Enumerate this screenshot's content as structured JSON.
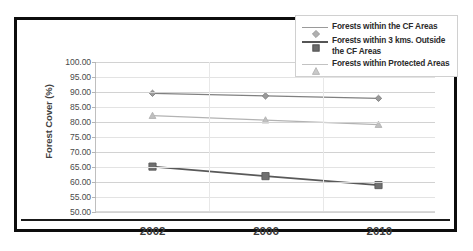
{
  "chart_data": {
    "type": "line",
    "title": "",
    "xlabel": "",
    "ylabel": "Forest Cover (%)",
    "categories": [
      "2002",
      "2006",
      "2010"
    ],
    "x": [
      2002,
      2006,
      2010
    ],
    "ylim": [
      50.0,
      100.0
    ],
    "ytick_labels": [
      "100.00",
      "95.00",
      "90.00",
      "85.00",
      "80.00",
      "75.00",
      "70.00",
      "65.00",
      "60.00",
      "55.00",
      "50.00"
    ],
    "ytick_values": [
      100.0,
      95.0,
      90.0,
      85.0,
      80.0,
      75.0,
      70.0,
      65.0,
      60.0,
      55.0,
      50.0
    ],
    "grid": true,
    "legend_position": "top-right",
    "series": [
      {
        "name": "Forests within the CF Areas",
        "values": [
          89.5,
          88.6,
          87.8
        ],
        "color": "#808080",
        "marker": "diamond",
        "marker_color": "#9a9a9a"
      },
      {
        "name": "Forests within 3 kms. Outside the CF Areas",
        "values": [
          64.9,
          61.7,
          58.7
        ],
        "color": "#595959",
        "marker": "square",
        "marker_color": "#707070"
      },
      {
        "name": "Forests within Protected Areas",
        "values": [
          82.0,
          80.5,
          79.0
        ],
        "color": "#b3b3b3",
        "marker": "triangle",
        "marker_color": "#bfbfbf"
      }
    ]
  },
  "legend": {
    "entries": [
      {
        "label": "Forests within the CF Areas"
      },
      {
        "label": "Forests within 3 kms. Outside the CF Areas"
      },
      {
        "label": "Forests within Protected Areas"
      }
    ]
  },
  "axes": {
    "y_title": "Forest Cover (%)"
  },
  "colors": {
    "frame": "#0d0d0d",
    "gridline": "#e3e3e3",
    "background": "#ffffff"
  }
}
